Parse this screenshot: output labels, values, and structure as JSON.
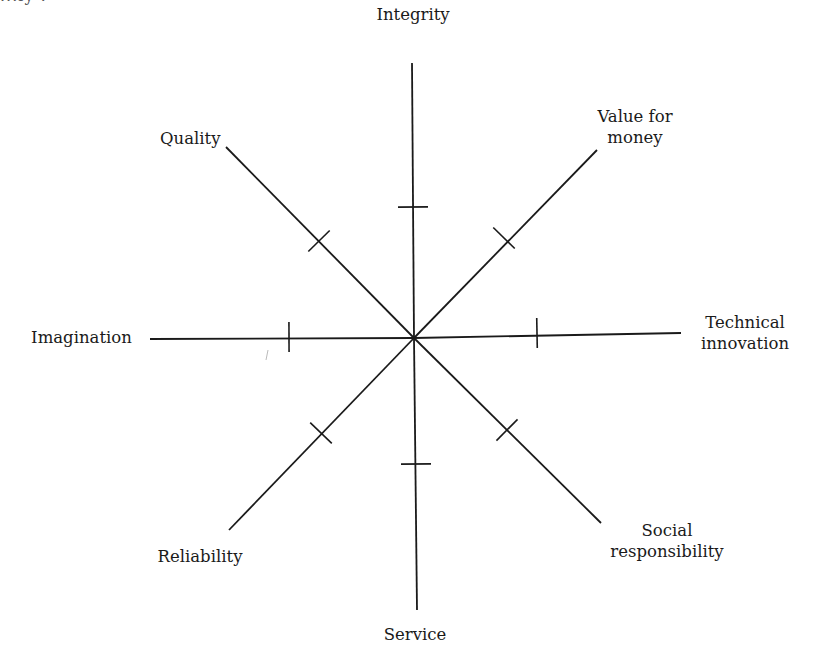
{
  "diagram": {
    "type": "radial-spoke-diagram",
    "center": {
      "x": 414,
      "y": 338
    },
    "line_color": "#1a1a1a",
    "top_cutoff_text": "...ly :",
    "axes": [
      {
        "id": "integrity",
        "label_lines": [
          "Integrity"
        ],
        "end": {
          "x": 412,
          "y": 63
        },
        "tick": {
          "x": 413,
          "y": 207
        },
        "label_pos": {
          "x": 368,
          "y": 4,
          "w": 90,
          "align": "center"
        }
      },
      {
        "id": "value-for-money",
        "label_lines": [
          "Value for",
          "money"
        ],
        "end": {
          "x": 597,
          "y": 150
        },
        "tick": {
          "x": 504,
          "y": 238
        },
        "label_pos": {
          "x": 590,
          "y": 106,
          "w": 90,
          "align": "center"
        }
      },
      {
        "id": "technical-innovation",
        "label_lines": [
          "Technical",
          "innovation"
        ],
        "end": {
          "x": 681,
          "y": 333
        },
        "tick": {
          "x": 537,
          "y": 333
        },
        "label_pos": {
          "x": 690,
          "y": 312,
          "w": 110,
          "align": "center"
        }
      },
      {
        "id": "social-responsibility",
        "label_lines": [
          "Social",
          "responsibility"
        ],
        "end": {
          "x": 601,
          "y": 523
        },
        "tick": {
          "x": 507,
          "y": 430
        },
        "label_pos": {
          "x": 597,
          "y": 520,
          "w": 140,
          "align": "center"
        }
      },
      {
        "id": "service",
        "label_lines": [
          "Service"
        ],
        "end": {
          "x": 417,
          "y": 610
        },
        "tick": {
          "x": 416,
          "y": 464
        },
        "label_pos": {
          "x": 370,
          "y": 624,
          "w": 90,
          "align": "center"
        }
      },
      {
        "id": "reliability",
        "label_lines": [
          "Reliability"
        ],
        "end": {
          "x": 229,
          "y": 530
        },
        "tick": {
          "x": 321,
          "y": 433
        },
        "label_pos": {
          "x": 150,
          "y": 546,
          "w": 100,
          "align": "center"
        }
      },
      {
        "id": "imagination",
        "label_lines": [
          "Imagination"
        ],
        "end": {
          "x": 150,
          "y": 339
        },
        "tick": {
          "x": 289,
          "y": 337
        },
        "label_pos": {
          "x": 24,
          "y": 327,
          "w": 115,
          "align": "center"
        }
      },
      {
        "id": "quality",
        "label_lines": [
          "Quality"
        ],
        "end": {
          "x": 226,
          "y": 147
        },
        "tick": {
          "x": 319,
          "y": 241
        },
        "label_pos": {
          "x": 160,
          "y": 128,
          "w": 60,
          "align": "center"
        }
      }
    ],
    "tick_half_length": 15,
    "stray_mark": {
      "x1": 268,
      "y1": 350,
      "x2": 266,
      "y2": 360
    }
  }
}
